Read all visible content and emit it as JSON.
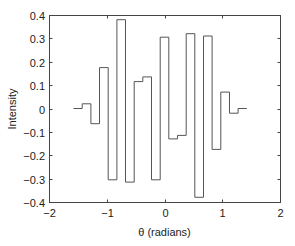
{
  "chart_data": {
    "type": "line",
    "style": "stairs",
    "title": "",
    "xlabel": "θ (radians)",
    "ylabel": "Intensity",
    "xlim": [
      -2,
      2
    ],
    "ylim": [
      -0.4,
      0.4
    ],
    "grid": false,
    "legend": null,
    "xticks": [
      -2,
      -1,
      0,
      1,
      2
    ],
    "xtick_labels": [
      "−2",
      "−1",
      "0",
      "1",
      "2"
    ],
    "yticks": [
      0.4,
      0.3,
      0.2,
      0.1,
      0,
      -0.1,
      -0.2,
      -0.3,
      -0.4
    ],
    "ytick_labels": [
      "0.4",
      "0.3",
      "0.2",
      "0.1",
      "0",
      "−0.1",
      "−0.2",
      "−0.3",
      "−0.4"
    ],
    "step_width": 0.15,
    "x": [
      -1.5,
      -1.35,
      -1.2,
      -1.05,
      -0.9,
      -0.75,
      -0.6,
      -0.45,
      -0.3,
      -0.15,
      0,
      0.15,
      0.3,
      0.45,
      0.6,
      0.75,
      0.9,
      1.05,
      1.2,
      1.35
    ],
    "series": [
      {
        "name": "Intensity",
        "color": "#555555",
        "values": [
          0.0,
          0.02,
          -0.065,
          0.175,
          -0.305,
          0.38,
          -0.315,
          0.115,
          0.135,
          -0.305,
          0.305,
          -0.13,
          -0.115,
          0.32,
          -0.38,
          0.31,
          -0.175,
          0.07,
          -0.02,
          0.0
        ]
      }
    ]
  },
  "colors": {
    "axes": "#444444",
    "line": "#555555",
    "text": "#222222"
  }
}
